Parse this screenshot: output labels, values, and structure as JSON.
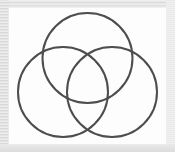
{
  "figure": {
    "title": "Three-circle Venn diagram",
    "kind": "venn-diagram",
    "background_color": "#fdfdfd",
    "frame_color": "#e6e6e6",
    "stroke_color": "#4d4d4d",
    "stroke_width": 2,
    "fill": "none",
    "canvas": {
      "x": 9,
      "y": 8,
      "width": 157,
      "height": 136
    },
    "circles": [
      {
        "name": "top-circle",
        "label": "",
        "cx": 78.5,
        "cy": 50,
        "r": 45,
        "stroke": "#4d4d4d"
      },
      {
        "name": "left-circle",
        "label": "",
        "cx": 54,
        "cy": 84,
        "r": 45,
        "stroke": "#4d4d4d"
      },
      {
        "name": "right-circle",
        "label": "",
        "cx": 103,
        "cy": 84,
        "r": 45,
        "stroke": "#4d4d4d"
      }
    ],
    "labels": []
  },
  "chart_data": {
    "type": "diagram",
    "subtype": "venn3",
    "title": "Three-circle Venn diagram",
    "xlabel": "",
    "ylabel": "",
    "sets": [
      "A",
      "B",
      "C"
    ],
    "set_labels_visible": false,
    "region_labels_visible": false,
    "values": [],
    "legend": [],
    "grid": false,
    "annotations": []
  }
}
